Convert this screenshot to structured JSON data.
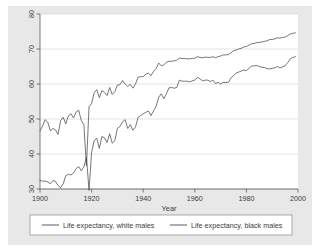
{
  "figure": {
    "background_color": "#e8e8e8",
    "plot_background_color": "#ffffff",
    "line_color": "#4a4a4a",
    "grid_color": "#d2d2d2",
    "axis_color": "#5a5a5a"
  },
  "axes": {
    "x_title": "Year",
    "y_title": "",
    "x_ticks": [
      "1900",
      "1920",
      "1940",
      "1960",
      "1980",
      "2000"
    ],
    "y_ticks": [
      "30",
      "40",
      "50",
      "60",
      "70",
      "80"
    ]
  },
  "legend": {
    "items": [
      {
        "label": "Life expectancy, white males"
      },
      {
        "label": "Life expectancy, black males"
      }
    ]
  },
  "chart_data": {
    "type": "line",
    "title": "",
    "subtitle": "",
    "xlabel": "Year",
    "ylabel": "",
    "xlim": [
      1900,
      2000
    ],
    "ylim": [
      30,
      80
    ],
    "grid": true,
    "legend_position": "bottom",
    "x_ticks": [
      1900,
      1920,
      1940,
      1960,
      1980,
      2000
    ],
    "y_ticks": [
      30,
      40,
      50,
      60,
      70,
      80
    ],
    "x": [
      1900,
      1901,
      1902,
      1903,
      1904,
      1905,
      1906,
      1907,
      1908,
      1909,
      1910,
      1911,
      1912,
      1913,
      1914,
      1915,
      1916,
      1917,
      1918,
      1919,
      1920,
      1921,
      1922,
      1923,
      1924,
      1925,
      1926,
      1927,
      1928,
      1929,
      1930,
      1931,
      1932,
      1933,
      1934,
      1935,
      1936,
      1937,
      1938,
      1939,
      1940,
      1941,
      1942,
      1943,
      1944,
      1945,
      1946,
      1947,
      1948,
      1949,
      1950,
      1951,
      1952,
      1953,
      1954,
      1955,
      1956,
      1957,
      1958,
      1959,
      1960,
      1961,
      1962,
      1963,
      1964,
      1965,
      1966,
      1967,
      1968,
      1969,
      1970,
      1971,
      1972,
      1973,
      1974,
      1975,
      1976,
      1977,
      1978,
      1979,
      1980,
      1981,
      1982,
      1983,
      1984,
      1985,
      1986,
      1987,
      1988,
      1989,
      1990,
      1991,
      1992,
      1993,
      1994,
      1995,
      1996,
      1997,
      1998,
      1999
    ],
    "series": [
      {
        "name": "Life expectancy, white males",
        "values": [
          46.6,
          48.0,
          49.8,
          49.1,
          46.6,
          47.3,
          46.9,
          45.6,
          49.5,
          50.5,
          48.6,
          50.9,
          51.5,
          50.3,
          52.0,
          52.5,
          49.6,
          48.4,
          36.6,
          53.5,
          54.4,
          57.5,
          58.4,
          56.1,
          58.1,
          57.6,
          56.7,
          59.0,
          57.0,
          57.8,
          59.7,
          59.8,
          61.0,
          60.0,
          59.3,
          59.9,
          58.8,
          60.0,
          61.9,
          62.1,
          62.1,
          62.8,
          63.1,
          62.4,
          63.6,
          64.4,
          66.0,
          65.2,
          65.5,
          66.2,
          66.5,
          66.5,
          66.6,
          66.8,
          67.4,
          67.3,
          67.3,
          67.2,
          67.2,
          67.3,
          67.4,
          67.8,
          67.6,
          67.5,
          67.7,
          67.6,
          67.6,
          67.8,
          67.5,
          67.8,
          68.0,
          68.3,
          68.3,
          68.4,
          68.9,
          69.5,
          69.7,
          70.0,
          70.2,
          70.6,
          70.7,
          71.1,
          71.5,
          71.6,
          71.8,
          71.9,
          72.0,
          72.2,
          72.3,
          72.7,
          72.7,
          72.9,
          73.2,
          73.1,
          73.3,
          73.4,
          73.8,
          74.3,
          74.5,
          74.6
        ]
      },
      {
        "name": "Life expectancy, black males",
        "values": [
          32.5,
          32.2,
          32.3,
          32.0,
          31.5,
          32.4,
          32.2,
          31.0,
          30.4,
          31.5,
          33.8,
          34.2,
          34.0,
          34.6,
          35.8,
          36.4,
          35.2,
          36.3,
          39.1,
          29.6,
          40.5,
          43.8,
          44.5,
          41.6,
          45.0,
          44.6,
          43.3,
          45.8,
          43.1,
          43.8,
          47.3,
          47.9,
          49.2,
          49.8,
          47.3,
          48.4,
          46.8,
          47.7,
          50.4,
          51.0,
          51.5,
          51.9,
          52.3,
          51.0,
          52.3,
          53.6,
          56.2,
          57.2,
          55.8,
          57.2,
          58.9,
          59.0,
          58.8,
          59.0,
          61.1,
          60.8,
          60.8,
          60.8,
          60.6,
          60.9,
          61.1,
          61.9,
          61.5,
          60.9,
          61.1,
          61.1,
          60.7,
          61.1,
          60.1,
          60.5,
          60.0,
          60.5,
          60.4,
          60.5,
          61.7,
          62.4,
          63.1,
          63.4,
          63.7,
          64.0,
          63.8,
          64.5,
          65.1,
          65.2,
          65.3,
          65.0,
          64.8,
          64.7,
          64.4,
          64.3,
          64.5,
          64.6,
          65.0,
          64.6,
          64.9,
          65.2,
          66.1,
          67.2,
          67.6,
          67.8
        ]
      }
    ]
  }
}
